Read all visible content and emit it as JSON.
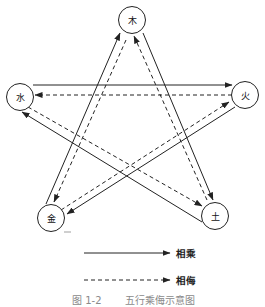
{
  "diagram": {
    "title": "五行乘侮示意图",
    "nodes": {
      "wood": {
        "label": "木"
      },
      "fire": {
        "label": "火"
      },
      "earth": {
        "label": "土"
      },
      "metal": {
        "label": "金"
      },
      "water": {
        "label": "水"
      }
    },
    "edges": [
      {
        "from": "水",
        "to": "火",
        "relation": "相乘",
        "style": "solid"
      },
      {
        "from": "火",
        "to": "水",
        "relation": "相侮",
        "style": "dashed"
      },
      {
        "from": "金",
        "to": "木",
        "relation": "相乘",
        "style": "solid"
      },
      {
        "from": "木",
        "to": "金",
        "relation": "相侮",
        "style": "dashed"
      },
      {
        "from": "木",
        "to": "土",
        "relation": "相乘",
        "style": "solid"
      },
      {
        "from": "土",
        "to": "木",
        "relation": "相侮",
        "style": "dashed"
      },
      {
        "from": "土",
        "to": "水",
        "relation": "相乘",
        "style": "solid"
      },
      {
        "from": "水",
        "to": "土",
        "relation": "相侮",
        "style": "dashed"
      },
      {
        "from": "火",
        "to": "金",
        "relation": "相乘",
        "style": "solid"
      },
      {
        "from": "金",
        "to": "火",
        "relation": "相侮",
        "style": "dashed"
      }
    ]
  },
  "legend": [
    {
      "label": "相乘",
      "style": "solid"
    },
    {
      "label": "相侮",
      "style": "dashed"
    }
  ],
  "caption": {
    "number": "图 1-2",
    "text": "五行乘侮示意图"
  },
  "colors": {
    "line": "#222222",
    "caption": "#8a8a8a",
    "background": "#ffffff"
  }
}
